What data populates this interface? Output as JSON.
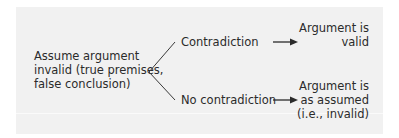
{
  "diagram": {
    "start": {
      "lines": [
        "Assume argument",
        "invalid (true premises,",
        "false conclusion)"
      ]
    },
    "branches": [
      {
        "label": "Contradiction",
        "outcome_lines": [
          "Argument is",
          "valid"
        ]
      },
      {
        "label": "No contradiction",
        "outcome_lines": [
          "Argument is",
          "as assumed",
          "(i.e., invalid)"
        ]
      }
    ],
    "colors": {
      "background": "#f1f1f1",
      "text": "#2b2b2b",
      "lines": "#3a3a3a"
    }
  }
}
